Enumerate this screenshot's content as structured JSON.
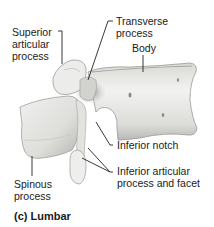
{
  "diagram": {
    "title": "(c) Lumbar",
    "labels": {
      "superior_articular_process": "Superior\narticular\nprocess",
      "transverse_process": "Transverse\nprocess",
      "body": "Body",
      "inferior_notch": "Inferior notch",
      "spinous_process": "Spinous\nprocess",
      "inferior_articular_process": "Inferior articular\nprocess and facet"
    },
    "colors": {
      "bone_light": "#e9e9e7",
      "bone_mid": "#c9c9c6",
      "bone_shadow": "#8a8a88",
      "leader_line": "#222222",
      "text": "#1a1a1a",
      "background": "#ffffff"
    }
  }
}
